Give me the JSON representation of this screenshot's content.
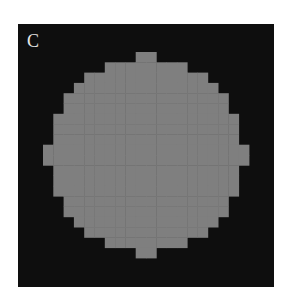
{
  "figure": {
    "panel_label": "C",
    "colors": {
      "background": "#0e0e0e",
      "disk": "#7f7f7f",
      "label": "#e6e6e6"
    },
    "disk": {
      "cx": 128,
      "cy": 131,
      "radius": 99,
      "cell": 10.3
    }
  }
}
